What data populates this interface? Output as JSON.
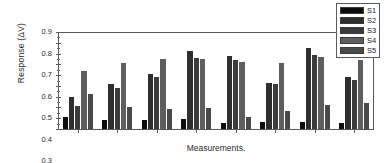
{
  "chart_data": {
    "type": "bar",
    "title": "",
    "subtitle": "",
    "xlabel": "Measurements.",
    "ylabel": "Response (ΔV)",
    "categories": [
      "1",
      "2",
      "3",
      "4",
      "5",
      "6",
      "7",
      "8"
    ],
    "ylim": [
      0.0,
      0.9
    ],
    "yticks": [
      "0.0",
      "0.1",
      "0.2",
      "0.3",
      "0.4",
      "0.5",
      "0.6",
      "0.7",
      "0.8",
      "0.9"
    ],
    "grid": false,
    "legend_position": "upper-right",
    "series": [
      {
        "name": "S1",
        "color": "#0d0d0d",
        "values": [
          0.115,
          0.088,
          0.085,
          0.09,
          0.057,
          0.068,
          0.063,
          0.057
        ]
      },
      {
        "name": "S2",
        "color": "#2e2e2e",
        "values": [
          0.295,
          0.415,
          0.51,
          0.725,
          0.68,
          0.425,
          0.755,
          0.48
        ]
      },
      {
        "name": "S3",
        "color": "#3b3b3b",
        "values": [
          0.21,
          0.38,
          0.487,
          0.66,
          0.642,
          0.42,
          0.688,
          0.458
        ]
      },
      {
        "name": "S4",
        "color": "#5e5e5e",
        "values": [
          0.54,
          0.615,
          0.645,
          0.652,
          0.622,
          0.61,
          0.668,
          0.642
        ]
      },
      {
        "name": "S5",
        "color": "#4a4a4a",
        "values": [
          0.322,
          0.203,
          0.185,
          0.192,
          0.11,
          0.17,
          0.222,
          0.245
        ]
      }
    ],
    "legend": [
      {
        "label": "S1",
        "color": "#0d0d0d"
      },
      {
        "label": "S2",
        "color": "#2e2e2e"
      },
      {
        "label": "S3",
        "color": "#3b3b3b"
      },
      {
        "label": "S4",
        "color": "#5e5e5e"
      },
      {
        "label": "S5",
        "color": "#4a4a4a"
      }
    ]
  }
}
